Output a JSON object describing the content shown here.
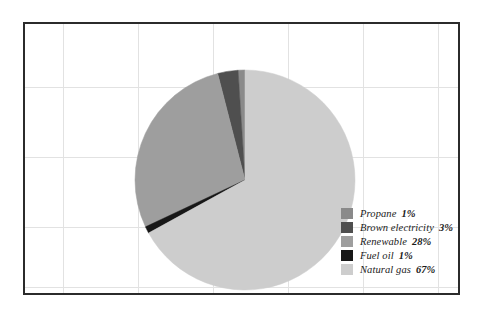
{
  "chart_data": {
    "type": "pie",
    "title": "",
    "subtitle": "",
    "xlabel": "",
    "ylabel": "",
    "grid": true,
    "legend_position": "inside-bottom-right",
    "categories": [
      "Propane",
      "Brown electricity",
      "Renewable",
      "Fuel oil",
      "Natural gas"
    ],
    "values": [
      1,
      3,
      28,
      1,
      67
    ],
    "value_labels": [
      "1%",
      "3%",
      "28%",
      "1%",
      "67%"
    ],
    "unit": "%",
    "slices": [
      {
        "label": "Propane",
        "value": 1,
        "value_label": "1%",
        "color": "#8a8a8a"
      },
      {
        "label": "Brown electricity",
        "value": 3,
        "value_label": "3%",
        "color": "#4f4f4f"
      },
      {
        "label": "Renewable",
        "value": 28,
        "value_label": "28%",
        "color": "#9e9e9e"
      },
      {
        "label": "Fuel oil",
        "value": 1,
        "value_label": "1%",
        "color": "#171717"
      },
      {
        "label": "Natural gas",
        "value": 67,
        "value_label": "67%",
        "color": "#cdcdcd"
      }
    ]
  },
  "chart": {
    "geometry": {
      "center_x": 220,
      "center_y": 156,
      "radius": 110,
      "start_angle_deg": 0,
      "direction": "counterclockwise"
    },
    "frame_color": "#2b2b2b",
    "grid_color": "#e2e2e2",
    "background_color": "#ffffff",
    "grid_vertical_x": [
      38,
      113,
      188,
      263,
      338,
      413
    ],
    "grid_horizontal_y": [
      63,
      133,
      203,
      263
    ]
  },
  "legend": {
    "items": [
      {
        "label": "Propane",
        "value_label": "1%",
        "color": "#8a8a8a"
      },
      {
        "label": "Brown electricity",
        "value_label": "3%",
        "color": "#4f4f4f"
      },
      {
        "label": "Renewable",
        "value_label": "28%",
        "color": "#9e9e9e"
      },
      {
        "label": "Fuel oil",
        "value_label": "1%",
        "color": "#171717"
      },
      {
        "label": "Natural gas",
        "value_label": "67%",
        "color": "#cdcdcd"
      }
    ]
  }
}
